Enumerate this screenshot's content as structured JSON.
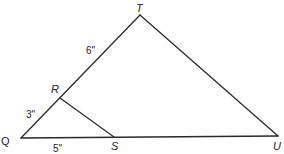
{
  "diagram": {
    "type": "geometry-triangle",
    "vertices": {
      "T": "T",
      "Q": "Q",
      "R": "R",
      "S": "S",
      "U": "U"
    },
    "segments": [
      {
        "from": "Q",
        "to": "T",
        "name": "QT"
      },
      {
        "from": "T",
        "to": "U",
        "name": "TU"
      },
      {
        "from": "Q",
        "to": "U",
        "name": "QU"
      },
      {
        "from": "R",
        "to": "S",
        "name": "RS"
      }
    ],
    "measures": {
      "RT": "6\"",
      "QR": "3\"",
      "QS": "5\""
    }
  }
}
